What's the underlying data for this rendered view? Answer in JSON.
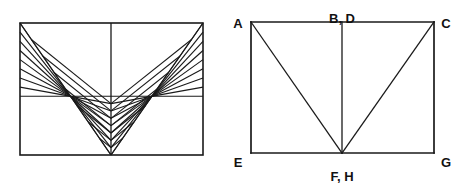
{
  "figure": {
    "background_color": "#ffffff",
    "stroke_color": "#1a1a1a",
    "label_color": "#111111"
  },
  "left_figure": {
    "name": "string-art-parabola-envelope",
    "description": "Rectangle with a vertical center line and two symmetric fans of straight line segments whose envelope forms a parabola",
    "rect": {
      "x": 20,
      "y": 23,
      "width": 183,
      "height": 132
    },
    "center_line_x": 111,
    "apex": {
      "x": 111,
      "y": 155
    },
    "fan_steps": 8,
    "labels": []
  },
  "right_figure": {
    "name": "labeled-rectangle-with-diagonals",
    "description": "Rectangle with vertical center line and two diagonals meeting at the bottom center",
    "rect": {
      "x": 251,
      "y": 22,
      "width": 183,
      "height": 131
    },
    "center_x": 342,
    "vertices": [
      {
        "id": "A",
        "label": "A",
        "x": 251,
        "y": 22,
        "label_x": 238,
        "label_y": 18,
        "anchor": "middle"
      },
      {
        "id": "BD",
        "label": "B, D",
        "x": 342,
        "y": 22,
        "label_x": 342,
        "label_y": 13,
        "anchor": "middle"
      },
      {
        "id": "C",
        "label": "C",
        "x": 434,
        "y": 22,
        "label_x": 446,
        "label_y": 18,
        "anchor": "middle"
      },
      {
        "id": "E",
        "label": "E",
        "x": 251,
        "y": 153,
        "label_x": 238,
        "label_y": 157,
        "anchor": "middle"
      },
      {
        "id": "FH",
        "label": "F, H",
        "x": 342,
        "y": 153,
        "label_x": 342,
        "label_y": 171,
        "anchor": "middle"
      },
      {
        "id": "G",
        "label": "G",
        "x": 434,
        "y": 153,
        "label_x": 446,
        "label_y": 157,
        "anchor": "middle"
      }
    ],
    "edges": [
      {
        "name": "top-edge",
        "from": "A",
        "to": "C"
      },
      {
        "name": "bottom-edge",
        "from": "E",
        "to": "G"
      },
      {
        "name": "left-edge",
        "from": "A",
        "to": "E"
      },
      {
        "name": "right-edge",
        "from": "C",
        "to": "G"
      },
      {
        "name": "center-vertical",
        "from": "BD",
        "to": "FH"
      },
      {
        "name": "diagonal-a-fh",
        "from": "A",
        "to": "FH"
      },
      {
        "name": "diagonal-c-fh",
        "from": "C",
        "to": "FH"
      }
    ]
  }
}
